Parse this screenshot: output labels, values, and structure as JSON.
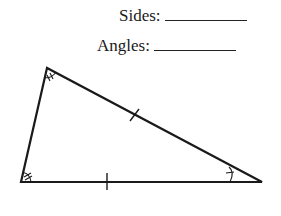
{
  "worksheet": {
    "fields": [
      {
        "label": "Sides:",
        "value": ""
      },
      {
        "label": "Angles:",
        "value": ""
      }
    ]
  },
  "triangle": {
    "vertices": {
      "top": [
        47,
        68
      ],
      "bottom_left": [
        21,
        182
      ],
      "bottom_right": [
        262,
        182
      ]
    },
    "side_marks": {
      "left_side": 0,
      "hypotenuse": 1,
      "bottom": 1
    },
    "angle_marks": {
      "top": "double-arc-ticks",
      "bottom_left": "double-arc-ticks",
      "bottom_right": "single-arc-tick"
    },
    "stroke_color": "#1a1a1a"
  }
}
